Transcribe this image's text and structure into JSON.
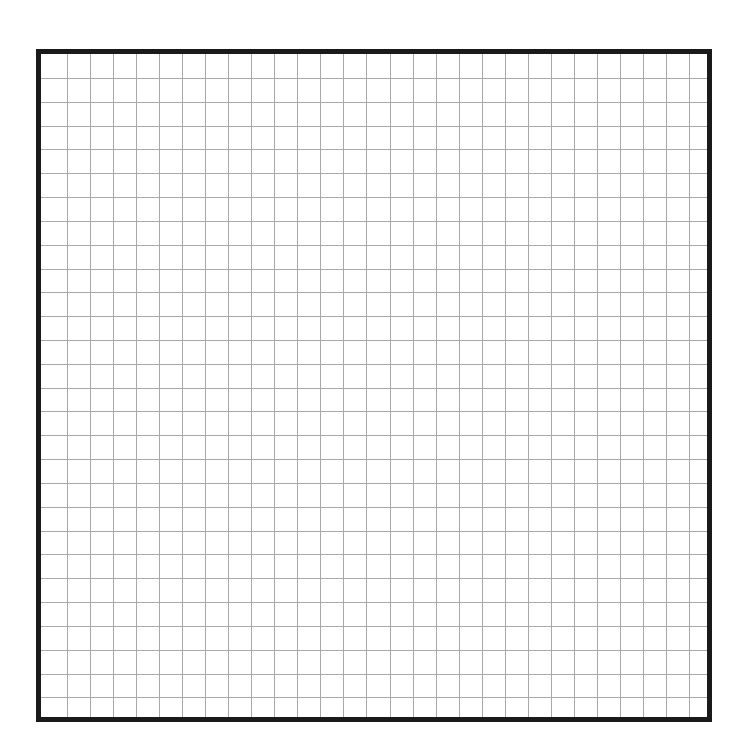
{
  "worksheet": {
    "grid": {
      "columns": 29,
      "rows": 28,
      "vertical_lines": 28,
      "horizontal_lines": 27,
      "first_vertical_offset": 25.7,
      "vertical_step": 23.06,
      "first_horizontal_offset": 24,
      "horizontal_step": 23.82,
      "line_color": "#a8a8a8",
      "border_color": "#1a1a1a",
      "background": "#ffffff"
    }
  }
}
